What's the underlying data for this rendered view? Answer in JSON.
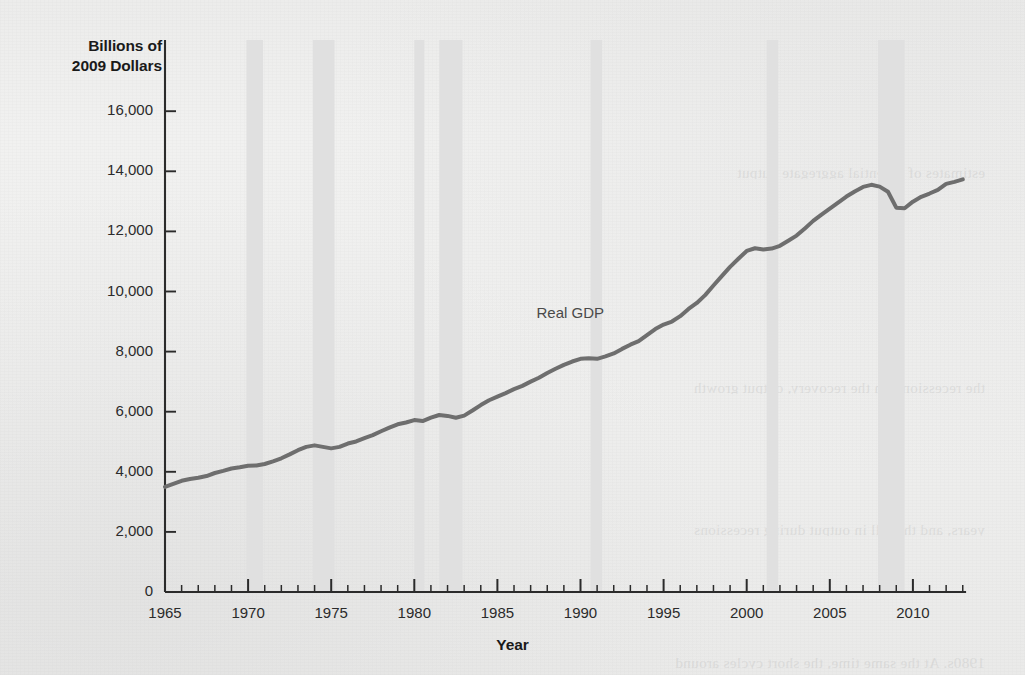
{
  "figure": {
    "y_axis_title": "Billions of\n2009 Dollars",
    "y_axis_title_line1": "Billions of",
    "y_axis_title_line2": "2009 Dollars",
    "x_axis_title": "Year",
    "series_annotation": "Real GDP",
    "line_color": "#6e6e6e",
    "recession_band_color": "#e0e0e0",
    "axis_color": "#2b2b2b",
    "ghost_lines": [
      "estimates of potential aggregate output",
      "the recessions. In the recovery, output growth",
      "years, and the fall in output during recessions",
      "1980s. At the same time, the short cycles around"
    ]
  },
  "chart_data": {
    "type": "line",
    "title": "",
    "xlabel": "Year",
    "ylabel": "Billions of 2009 Dollars",
    "xlim": [
      1965,
      2013.2
    ],
    "ylim": [
      0,
      16800
    ],
    "grid": false,
    "legend": "inline-annotation",
    "y_ticks": [
      "0",
      "2,000",
      "4,000",
      "6,000",
      "8,000",
      "10,000",
      "12,000",
      "14,000",
      "16,000"
    ],
    "y_tick_values": [
      0,
      2000,
      4000,
      6000,
      8000,
      10000,
      12000,
      14000,
      16000
    ],
    "x_ticks": [
      "1965",
      "1970",
      "1975",
      "1980",
      "1985",
      "1990",
      "1995",
      "2000",
      "2005",
      "2010"
    ],
    "x_tick_values": [
      1965,
      1970,
      1975,
      1980,
      1985,
      1990,
      1995,
      2000,
      2005,
      2010
    ],
    "x_minor_tick_interval": 1,
    "series": [
      {
        "name": "Real GDP",
        "color": "#6e6e6e",
        "x": [
          1965.0,
          1965.5,
          1966.0,
          1966.5,
          1967.0,
          1967.5,
          1968.0,
          1968.5,
          1969.0,
          1969.5,
          1970.0,
          1970.5,
          1971.0,
          1971.5,
          1972.0,
          1972.5,
          1973.0,
          1973.5,
          1974.0,
          1974.5,
          1975.0,
          1975.5,
          1976.0,
          1976.5,
          1977.0,
          1977.5,
          1978.0,
          1978.5,
          1979.0,
          1979.5,
          1980.0,
          1980.5,
          1981.0,
          1981.5,
          1982.0,
          1982.5,
          1983.0,
          1983.5,
          1984.0,
          1984.5,
          1985.0,
          1985.5,
          1986.0,
          1986.5,
          1987.0,
          1987.5,
          1988.0,
          1988.5,
          1989.0,
          1989.5,
          1990.0,
          1990.5,
          1991.0,
          1991.5,
          1992.0,
          1992.5,
          1993.0,
          1993.5,
          1994.0,
          1994.5,
          1995.0,
          1995.5,
          1996.0,
          1996.5,
          1997.0,
          1997.5,
          1998.0,
          1998.5,
          1999.0,
          1999.5,
          2000.0,
          2000.5,
          2001.0,
          2001.5,
          2002.0,
          2002.5,
          2003.0,
          2003.5,
          2004.0,
          2004.5,
          2005.0,
          2005.5,
          2006.0,
          2006.5,
          2007.0,
          2007.5,
          2008.0,
          2008.5,
          2009.0,
          2009.5,
          2010.0,
          2010.5,
          2011.0,
          2011.5,
          2012.0,
          2012.5,
          2013.0
        ],
        "y": [
          3500,
          3600,
          3700,
          3760,
          3800,
          3860,
          3960,
          4030,
          4110,
          4150,
          4200,
          4210,
          4260,
          4350,
          4450,
          4580,
          4720,
          4830,
          4880,
          4830,
          4780,
          4830,
          4940,
          5010,
          5120,
          5220,
          5350,
          5470,
          5580,
          5640,
          5720,
          5690,
          5800,
          5890,
          5860,
          5800,
          5870,
          6040,
          6220,
          6380,
          6500,
          6620,
          6750,
          6860,
          7000,
          7130,
          7290,
          7430,
          7560,
          7670,
          7760,
          7780,
          7760,
          7840,
          7940,
          8090,
          8230,
          8350,
          8550,
          8750,
          8900,
          9000,
          9180,
          9420,
          9620,
          9880,
          10200,
          10510,
          10820,
          11090,
          11350,
          11440,
          11400,
          11430,
          11520,
          11690,
          11860,
          12100,
          12350,
          12560,
          12760,
          12960,
          13160,
          13330,
          13480,
          13550,
          13490,
          13320,
          12790,
          12770,
          12990,
          13150,
          13260,
          13380,
          13580,
          13650,
          13730
        ]
      }
    ],
    "shaded_regions": {
      "label": "recessions",
      "color": "#e0e0e0",
      "bands": [
        {
          "start": 1969.9,
          "end": 1970.9
        },
        {
          "start": 1973.9,
          "end": 1975.2
        },
        {
          "start": 1980.0,
          "end": 1980.6
        },
        {
          "start": 1981.5,
          "end": 1982.9
        },
        {
          "start": 1990.6,
          "end": 1991.3
        },
        {
          "start": 2001.2,
          "end": 2001.9
        },
        {
          "start": 2007.9,
          "end": 2009.5
        }
      ]
    },
    "annotations": [
      {
        "text": "Real GDP",
        "x": 1990.0,
        "y": 9250
      }
    ]
  }
}
